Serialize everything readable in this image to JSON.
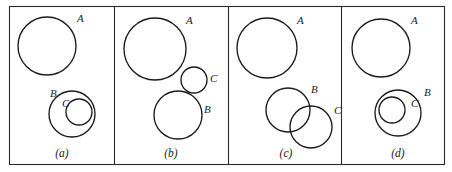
{
  "figure": {
    "width": 452,
    "height": 172,
    "background_color": "#ffffff",
    "stroke_color": "#1a1a1a",
    "frame_color": "#2b2b2b"
  },
  "frame": {
    "x": 9,
    "y": 6,
    "width": 435,
    "height": 158,
    "dividers_x": [
      114,
      228,
      341
    ]
  },
  "panels": [
    {
      "caption": "(a)",
      "caption_x": 62,
      "caption_y": 157,
      "relation": "A disjoint from B; C inside B",
      "circles": [
        {
          "label": "A",
          "cx": 47,
          "cy": 46,
          "r": 29,
          "label_x": 77,
          "label_y": 22
        },
        {
          "label": "B",
          "cx": 72,
          "cy": 114,
          "r": 23,
          "label_x": 50,
          "label_y": 97
        },
        {
          "label": "C",
          "cx": 79,
          "cy": 112,
          "r": 13,
          "label_x": 62,
          "label_y": 107
        }
      ]
    },
    {
      "caption": "(b)",
      "caption_x": 171,
      "caption_y": 157,
      "relation": "A disjoint from B and C; B tangent to C",
      "circles": [
        {
          "label": "A",
          "cx": 155,
          "cy": 49,
          "r": 31,
          "label_x": 186,
          "label_y": 24
        },
        {
          "label": "C",
          "cx": 194,
          "cy": 80,
          "r": 13,
          "label_x": 210,
          "label_y": 82
        },
        {
          "label": "B",
          "cx": 178,
          "cy": 115,
          "r": 24,
          "label_x": 204,
          "label_y": 113
        }
      ]
    },
    {
      "caption": "(c)",
      "caption_x": 286,
      "caption_y": 157,
      "relation": "A disjoint from B and C; B overlaps C",
      "circles": [
        {
          "label": "A",
          "cx": 267,
          "cy": 48,
          "r": 30,
          "label_x": 297,
          "label_y": 24
        },
        {
          "label": "B",
          "cx": 288,
          "cy": 110,
          "r": 22,
          "label_x": 311,
          "label_y": 93
        },
        {
          "label": "C",
          "cx": 311,
          "cy": 127,
          "r": 21,
          "label_x": 334,
          "label_y": 114
        }
      ]
    },
    {
      "caption": "(d)",
      "caption_x": 398,
      "caption_y": 157,
      "relation": "A disjoint from B; C inside B",
      "circles": [
        {
          "label": "A",
          "cx": 381,
          "cy": 48,
          "r": 29,
          "label_x": 411,
          "label_y": 24
        },
        {
          "label": "B",
          "cx": 398,
          "cy": 113,
          "r": 23,
          "label_x": 424,
          "label_y": 96
        },
        {
          "label": "C",
          "cx": 392,
          "cy": 110,
          "r": 13,
          "label_x": 411,
          "label_y": 107
        }
      ]
    }
  ]
}
